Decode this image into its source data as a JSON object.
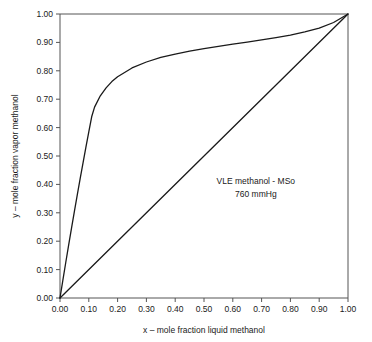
{
  "chart_data": {
    "type": "line",
    "title": "",
    "xlabel": "x – mole fraction liquid methanol",
    "ylabel": "y – mole fraction vapor methanol",
    "xlim": [
      0,
      1
    ],
    "ylim": [
      0,
      1
    ],
    "grid": false,
    "legend_position": "none",
    "xticks": [
      "0.00",
      "0.10",
      "0.20",
      "0.30",
      "0.40",
      "0.50",
      "0.60",
      "0.70",
      "0.80",
      "0.90",
      "1.00"
    ],
    "yticks": [
      "0.00",
      "0.10",
      "0.20",
      "0.30",
      "0.40",
      "0.50",
      "0.60",
      "0.70",
      "0.80",
      "0.90",
      "1.00"
    ],
    "xtick_values": [
      0.0,
      0.1,
      0.2,
      0.3,
      0.4,
      0.5,
      0.6,
      0.7,
      0.8,
      0.9,
      1.0
    ],
    "ytick_values": [
      0.0,
      0.1,
      0.2,
      0.3,
      0.4,
      0.5,
      0.6,
      0.7,
      0.8,
      0.9,
      1.0
    ],
    "annotations": [
      {
        "text": "VLE methanol - MSo",
        "x": 0.68,
        "y": 0.4
      },
      {
        "text": "760 mmHg",
        "x": 0.68,
        "y": 0.355
      }
    ],
    "series": [
      {
        "name": "equilibrium-curve",
        "color": "#1a1a1a",
        "x": [
          0.0,
          0.01,
          0.02,
          0.03,
          0.04,
          0.05,
          0.06,
          0.07,
          0.08,
          0.09,
          0.1,
          0.11,
          0.12,
          0.14,
          0.16,
          0.18,
          0.2,
          0.25,
          0.3,
          0.35,
          0.4,
          0.45,
          0.5,
          0.55,
          0.6,
          0.65,
          0.7,
          0.75,
          0.8,
          0.85,
          0.9,
          0.95,
          1.0
        ],
        "y": [
          0.0,
          0.063,
          0.125,
          0.186,
          0.246,
          0.305,
          0.363,
          0.42,
          0.476,
          0.531,
          0.585,
          0.638,
          0.672,
          0.712,
          0.74,
          0.762,
          0.779,
          0.81,
          0.831,
          0.847,
          0.859,
          0.869,
          0.878,
          0.886,
          0.894,
          0.901,
          0.909,
          0.917,
          0.926,
          0.937,
          0.95,
          0.97,
          1.0
        ]
      },
      {
        "name": "45-degree-diagonal",
        "color": "#1a1a1a",
        "x": [
          0.0,
          1.0
        ],
        "y": [
          0.0,
          1.0
        ]
      }
    ]
  },
  "axes": {
    "x_title": "x – mole fraction liquid methanol",
    "y_title": "y – mole fraction vapor methanol"
  },
  "annotation_block": {
    "line1": "VLE methanol - MSo",
    "line2": "760 mmHg"
  },
  "colors": {
    "curve": "#1a1a1a",
    "axis": "#555555",
    "background": "#ffffff",
    "text": "#1a1a1a"
  }
}
